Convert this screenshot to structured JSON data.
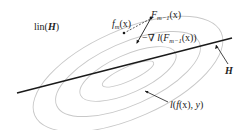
{
  "labels": {
    "lin_prefix": "lin(",
    "lin_H": "H",
    "lin_suffix": ")",
    "fm_f": "f",
    "fm_sub": "m",
    "fm_arg": "(x)",
    "Fm1_F": "F",
    "Fm1_sub": "m−1",
    "Fm1_arg": "(x)",
    "grad_prefix": "−∇ ",
    "grad_l": "l",
    "grad_open": "(",
    "grad_F": "F",
    "grad_sub": "m−1",
    "grad_close": "(x))",
    "H": "H",
    "loss_l": "l",
    "loss_open": "(",
    "loss_f": "f",
    "loss_mid": "(x), ",
    "loss_y": "y",
    "loss_close": ")"
  },
  "colors": {
    "contour": "#c8c8c8",
    "line": "#1a1a1a",
    "text": "#222222"
  }
}
